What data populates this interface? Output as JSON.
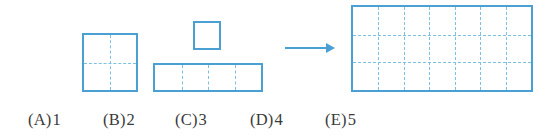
{
  "page": {
    "background_color": "#ffffff",
    "width": 557,
    "height": 137,
    "kind": "geometry-multiple-choice-figure"
  },
  "colors": {
    "shape_border": "#4a9fd3",
    "grid_dash": "#7cc0e4",
    "arrow": "#4a9fd3",
    "text": "#3a3a3a"
  },
  "figure": {
    "source_shapes": [
      {
        "id": "shape-square-2x2",
        "label": "2 by 2 square",
        "cols": 2,
        "rows": 3,
        "unit_cells": 4,
        "x": 82,
        "y": 33,
        "width": 56,
        "height": 59
      },
      {
        "id": "shape-unit-square",
        "label": "single unit square",
        "cols": 1,
        "rows": 1,
        "unit_cells": 1,
        "x": 193,
        "y": 21,
        "width": 28,
        "height": 29
      },
      {
        "id": "shape-row-1x4",
        "label": "1 by 4 row",
        "cols": 4,
        "rows": 1,
        "unit_cells": 4,
        "x": 153,
        "y": 63,
        "width": 110,
        "height": 29
      }
    ],
    "arrow": {
      "id": "transform-arrow",
      "direction": "right",
      "x": 285,
      "y": 42,
      "width": 50,
      "height": 12
    },
    "target_shape": {
      "id": "shape-rectangle-7x3",
      "label": "7 by 3 rectangle",
      "cols": 7,
      "rows": 3,
      "unit_cells": 21,
      "x": 351,
      "y": 5,
      "width": 182,
      "height": 87
    }
  },
  "choices": [
    {
      "id": "A",
      "paren": "(A)",
      "value": "1",
      "x": 28
    },
    {
      "id": "B",
      "paren": "(B)",
      "value": "2",
      "x": 103
    },
    {
      "id": "C",
      "paren": "(C)",
      "value": "3",
      "x": 175
    },
    {
      "id": "D",
      "paren": "(D)",
      "value": "4",
      "x": 250
    },
    {
      "id": "E",
      "paren": "(E)",
      "value": "5",
      "x": 325
    }
  ]
}
